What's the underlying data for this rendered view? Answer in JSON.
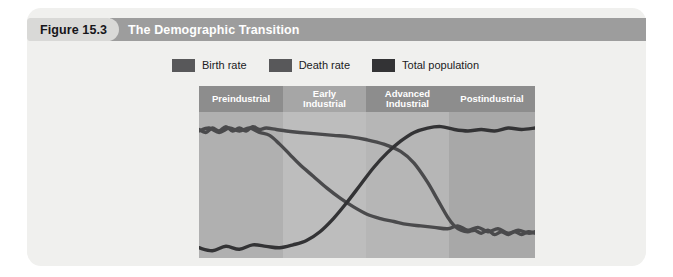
{
  "figure": {
    "number_label": "Figure 15.3",
    "title": "The Demographic Transition"
  },
  "legend": {
    "entries": [
      {
        "label": "Birth rate",
        "color": "#58585a"
      },
      {
        "label": "Death rate",
        "color": "#58585a"
      },
      {
        "label": "Total population",
        "color": "#333335"
      }
    ]
  },
  "colors": {
    "card_background": "#f0f0ee",
    "header_bar": "#9d9d9d",
    "number_tag": "#d9d9d7",
    "stage_header_dark": "#8d8d8d",
    "stage_header_light": "#a6a6a6",
    "line": "#4a4a4c"
  },
  "chart_data": {
    "type": "line",
    "title": "The Demographic Transition",
    "xlabel": "",
    "ylabel": "",
    "grid": false,
    "legend_position": "top",
    "xlim": [
      0,
      100
    ],
    "ylim": [
      0,
      100
    ],
    "stages": [
      {
        "label": "Preindustrial",
        "lines": [
          "Preindustrial"
        ],
        "x_start": 0,
        "x_end": 25,
        "band_shade": "#b0b0b0",
        "header_shade": "#8d8d8d"
      },
      {
        "label": "Early Industrial",
        "lines": [
          "Early",
          "Industrial"
        ],
        "x_start": 25,
        "x_end": 49.7,
        "band_shade": "#bdbdbd",
        "header_shade": "#a6a6a6"
      },
      {
        "label": "Advanced Industrial",
        "lines": [
          "Advanced",
          "Industrial"
        ],
        "x_start": 49.7,
        "x_end": 74.4,
        "band_shade": "#b6b6b6",
        "header_shade": "#8d8d8d"
      },
      {
        "label": "Postindustrial",
        "lines": [
          "Postindustrial"
        ],
        "x_start": 74.4,
        "x_end": 100,
        "band_shade": "#a8a8a8",
        "header_shade": "#8d8d8d"
      }
    ],
    "series": [
      {
        "name": "Birth rate",
        "color": "#4a4a4c",
        "x": [
          0,
          2,
          4,
          6,
          8,
          10,
          12,
          14,
          16,
          18,
          20,
          23,
          26,
          30,
          35,
          40,
          45,
          50,
          55,
          60,
          64,
          68,
          71,
          74,
          76,
          78,
          80,
          82,
          84,
          86,
          88,
          90,
          92,
          94,
          96,
          98,
          100
        ],
        "y": [
          88,
          86,
          89,
          87,
          90,
          87,
          89,
          87,
          90,
          88,
          89,
          88,
          87,
          86,
          85,
          84,
          83,
          81,
          78,
          73,
          65,
          52,
          40,
          28,
          22,
          19,
          18,
          19,
          17,
          19,
          16,
          18,
          16,
          18,
          16,
          18,
          17
        ]
      },
      {
        "name": "Death rate",
        "color": "#4a4a4c",
        "x": [
          0,
          3,
          6,
          9,
          12,
          15,
          18,
          21,
          24,
          27,
          30,
          34,
          38,
          42,
          46,
          50,
          54,
          58,
          62,
          66,
          70,
          74,
          77,
          80,
          83,
          86,
          89,
          92,
          95,
          98,
          100
        ],
        "y": [
          87,
          89,
          86,
          89,
          87,
          89,
          86,
          84,
          78,
          71,
          64,
          56,
          48,
          41,
          35,
          30,
          27,
          25,
          23,
          22,
          21,
          20,
          22,
          19,
          21,
          18,
          20,
          17,
          19,
          17,
          18
        ]
      },
      {
        "name": "Total population",
        "color": "#333335",
        "x": [
          0,
          4,
          8,
          12,
          16,
          20,
          24,
          28,
          32,
          36,
          40,
          44,
          48,
          52,
          56,
          60,
          64,
          68,
          72,
          76,
          80,
          84,
          88,
          92,
          96,
          100
        ],
        "y": [
          7,
          5,
          8,
          6,
          9,
          8,
          7,
          9,
          12,
          18,
          27,
          38,
          50,
          62,
          72,
          80,
          86,
          89,
          90,
          88,
          87,
          88,
          87,
          89,
          88,
          89
        ]
      }
    ]
  }
}
